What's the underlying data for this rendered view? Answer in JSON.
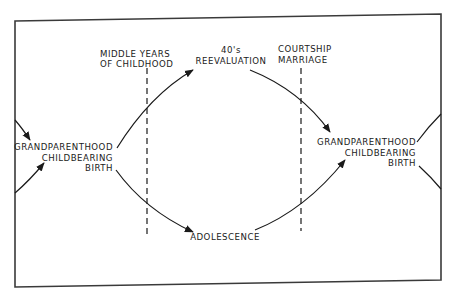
{
  "diagram": {
    "type": "cyclic life-stage flow",
    "colors": {
      "ink": "#1a1a1a",
      "frame": "#3a3a3a",
      "background": "#ffffff"
    },
    "nodes": {
      "left_cluster": {
        "line1": "GRANDPARENTHOOD",
        "line2": "CHILDBEARING",
        "line3": "BIRTH"
      },
      "right_cluster": {
        "line1": "GRANDPARENTHOOD",
        "line2": "CHILDBEARING",
        "line3": "BIRTH"
      },
      "top": {
        "line1": "40's",
        "line2": "REEVALUATION"
      },
      "bottom": {
        "line1": "ADOLESCENCE"
      }
    },
    "dividers": [
      {
        "line1": "MIDDLE YEARS",
        "line2": "OF CHILDHOOD"
      },
      {
        "line1": "COURTSHIP",
        "line2": "MARRIAGE"
      }
    ],
    "edges": [
      {
        "from": "left_cluster",
        "to": "top"
      },
      {
        "from": "top",
        "to": "right_cluster"
      },
      {
        "from": "left_cluster",
        "to": "bottom"
      },
      {
        "from": "bottom",
        "to": "right_cluster"
      },
      {
        "from": "offscreen-left-top",
        "to": "left_cluster"
      },
      {
        "from": "offscreen-left-bottom",
        "to": "left_cluster"
      },
      {
        "from": "right_cluster",
        "to": "offscreen-right"
      }
    ]
  }
}
